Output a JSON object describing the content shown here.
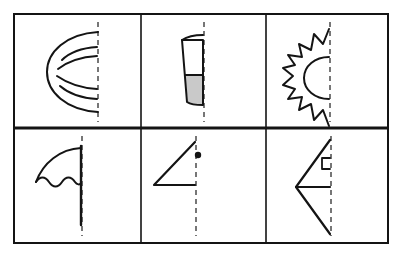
{
  "worksheet": {
    "title": "Line of Symmetry Worksheet",
    "description": "Grid of six cells, each showing one half of a figure next to a dashed vertical line of symmetry.",
    "background_color": "#ffffff",
    "ink_color": "#141414",
    "shading_color": "#c9c9c9",
    "dash_color": "#4a4a4a",
    "grid": {
      "columns": 3,
      "rows": 2,
      "outer_border_px": 2,
      "inner_divider_px": 1.6,
      "mid_divider_px": 3,
      "x": 14,
      "y": 14,
      "width": 374,
      "height": 229,
      "column_x": [
        14,
        141,
        266,
        388
      ],
      "row_y": [
        14,
        128,
        243
      ]
    },
    "dashed_line": {
      "label": "line-of-symmetry",
      "style": "dashed",
      "orientation": "vertical",
      "dash_pattern": "5 4"
    },
    "cells": [
      {
        "position": "top-left",
        "index": 1,
        "figure": "globe-hemisphere",
        "figure_label": "Globe",
        "shaded": false,
        "marker": "none",
        "latitude_lines": 4,
        "axis_x": 98
      },
      {
        "position": "top-center",
        "index": 2,
        "figure": "drinking-glass",
        "figure_label": "Glass",
        "shaded": true,
        "marker": "none",
        "fill_level": "half",
        "axis_x": 204
      },
      {
        "position": "top-right",
        "index": 3,
        "figure": "sun-with-rays",
        "figure_label": "Sun",
        "shaded": false,
        "marker": "none",
        "ray_count": 9,
        "axis_x": 330
      },
      {
        "position": "bottom-left",
        "index": 4,
        "figure": "umbrella",
        "figure_label": "Umbrella",
        "shaded": false,
        "marker": "none",
        "scallops": 3,
        "axis_x": 82
      },
      {
        "position": "bottom-center",
        "index": 5,
        "figure": "right-triangle",
        "figure_label": "Triangle",
        "shaded": false,
        "marker": "dot",
        "axis_x": 196
      },
      {
        "position": "bottom-right",
        "index": 6,
        "figure": "arrow-triangle",
        "figure_label": "Arrow",
        "shaded": false,
        "marker": "right-angle-square",
        "axis_x": 331
      }
    ]
  }
}
